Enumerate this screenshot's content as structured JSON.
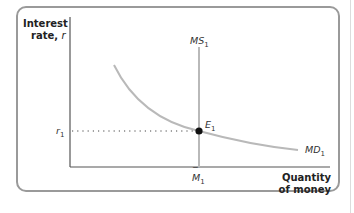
{
  "diagram": {
    "y_axis": {
      "line1": "Interest",
      "line2": "rate, ",
      "var": "r"
    },
    "x_axis": {
      "line1": "Quantity",
      "line2": "of money"
    },
    "curves": {
      "supply": {
        "name": "MS",
        "sub": "1"
      },
      "demand": {
        "name": "MD",
        "sub": "1"
      }
    },
    "equilibrium": {
      "name": "E",
      "sub": "1"
    },
    "r_tick": {
      "name": "r",
      "sub": "1"
    },
    "m_tick": {
      "name": "M",
      "sub": "1",
      "bar": "‾"
    },
    "colors": {
      "curve": "#b9b9b9",
      "axis": "#555555",
      "frame": "#9a9a9a",
      "point": "#111111"
    }
  }
}
